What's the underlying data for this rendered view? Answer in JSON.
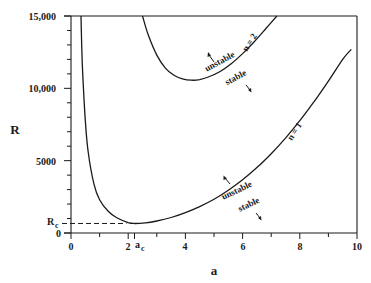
{
  "chart_data": {
    "type": "line",
    "title": "",
    "xlabel": "a",
    "ylabel": "R",
    "xlim": [
      0,
      10
    ],
    "ylim": [
      0,
      15000
    ],
    "x_ticks": [
      {
        "value": 0,
        "label": "0"
      },
      {
        "value": 2,
        "label": "2"
      },
      {
        "value": 4,
        "label": "4"
      },
      {
        "value": 6,
        "label": "6"
      },
      {
        "value": 8,
        "label": "8"
      },
      {
        "value": 10,
        "label": "10"
      }
    ],
    "y_ticks": [
      {
        "value": 0,
        "label": "0"
      },
      {
        "value": 5000,
        "label": "5000"
      },
      {
        "value": 10000,
        "label": "10,000"
      },
      {
        "value": 15000,
        "label": "15,000"
      }
    ],
    "grid": false,
    "critical_point": {
      "a_c": 2.22,
      "R_c": 658,
      "a_label": "a",
      "a_sub": "c",
      "R_label": "R",
      "R_sub": "c"
    },
    "series": [
      {
        "name": "n = 1",
        "label": "n = 1",
        "x": [
          0.35,
          0.4,
          0.5,
          0.6,
          0.8,
          1.0,
          1.3,
          1.6,
          2.0,
          2.22,
          2.6,
          3.0,
          3.5,
          4.0,
          4.5,
          5.0,
          5.5,
          6.0,
          6.5,
          7.0,
          7.5,
          8.0,
          8.5,
          9.0,
          9.5,
          9.8
        ],
        "y": [
          15000,
          11500,
          7800,
          5600,
          3400,
          2300,
          1500,
          1050,
          720,
          658,
          700,
          830,
          1070,
          1400,
          1820,
          2330,
          2950,
          3680,
          4520,
          5480,
          6560,
          7760,
          9080,
          10500,
          12000,
          12700
        ]
      },
      {
        "name": "n = 2",
        "label": "n = 2",
        "x": [
          2.5,
          2.7,
          3.0,
          3.3,
          3.6,
          3.9,
          4.2,
          4.5,
          4.8,
          5.2,
          5.6,
          6.0,
          6.4,
          6.8,
          7.2
        ],
        "y": [
          15000,
          13700,
          12300,
          11400,
          10900,
          10650,
          10560,
          10600,
          10780,
          11150,
          11700,
          12400,
          13200,
          14100,
          15000
        ]
      }
    ],
    "annotations": [
      {
        "text": "unstable",
        "curve": "n = 2",
        "arrow": "up-left"
      },
      {
        "text": "stable",
        "curve": "n = 2",
        "arrow": "down-right"
      },
      {
        "text": "unstable",
        "curve": "n = 1",
        "arrow": "up-left"
      },
      {
        "text": "stable",
        "curve": "n = 1",
        "arrow": "down-right"
      }
    ]
  },
  "labels": {
    "x_axis": "a",
    "y_axis": "R",
    "rc_main": "R",
    "rc_sub": "c",
    "ac_main": "a",
    "ac_sub": "c",
    "n1": "n = 1",
    "n2": "n = 2",
    "unstable": "unstable",
    "stable": "stable",
    "y0": "0",
    "y5000": "5000",
    "y10000": "10,000",
    "y15000": "15,000",
    "x0": "0",
    "x2": "2",
    "x4": "4",
    "x6": "6",
    "x8": "8",
    "x10": "10"
  }
}
